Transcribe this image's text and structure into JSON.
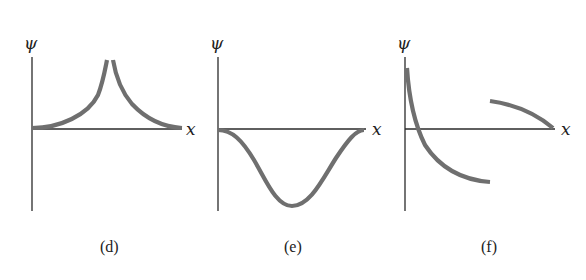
{
  "figure": {
    "panels": [
      {
        "id": "d",
        "caption": "(d)",
        "y_axis_label": "ψ",
        "x_axis_label": "x",
        "description": "Cusp: curve rises from zero on both sides toward a sharp, discontinuous peak at center"
      },
      {
        "id": "e",
        "caption": "(e)",
        "y_axis_label": "ψ",
        "x_axis_label": "x",
        "description": "Smooth single negative trough starting and ending at zero"
      },
      {
        "id": "f",
        "caption": "(f)",
        "y_axis_label": "ψ",
        "x_axis_label": "x",
        "description": "Discontinuous: decaying curve crossing axis, then a jump to a separate positive arc ending at zero"
      }
    ],
    "colors": {
      "axis": "#2a2a2a",
      "curve": "#6f6f6f",
      "text": "#222222"
    }
  }
}
